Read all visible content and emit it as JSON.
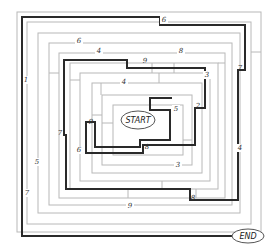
{
  "diagram": {
    "type": "maze",
    "start_label": "START",
    "end_label": "END",
    "path_numbers": [
      {
        "text": "6",
        "x": 164,
        "y": 22
      },
      {
        "text": "6",
        "x": 79,
        "y": 43
      },
      {
        "text": "4",
        "x": 99,
        "y": 53
      },
      {
        "text": "8",
        "x": 181,
        "y": 53
      },
      {
        "text": "7",
        "x": 240,
        "y": 70
      },
      {
        "text": "1",
        "x": 26,
        "y": 82
      },
      {
        "text": "9",
        "x": 145,
        "y": 62
      },
      {
        "text": "3",
        "x": 207,
        "y": 77
      },
      {
        "text": "4",
        "x": 124,
        "y": 84
      },
      {
        "text": "2",
        "x": 197,
        "y": 108
      },
      {
        "text": "5",
        "x": 176,
        "y": 111
      },
      {
        "text": "9",
        "x": 91,
        "y": 124
      },
      {
        "text": "7",
        "x": 60,
        "y": 135
      },
      {
        "text": "6",
        "x": 79,
        "y": 152
      },
      {
        "text": "8",
        "x": 146,
        "y": 147
      },
      {
        "text": "4",
        "x": 240,
        "y": 150
      },
      {
        "text": "5",
        "x": 37,
        "y": 164
      },
      {
        "text": "3",
        "x": 178,
        "y": 167
      },
      {
        "text": "7",
        "x": 27,
        "y": 195
      },
      {
        "text": "8",
        "x": 193,
        "y": 199
      },
      {
        "text": "9",
        "x": 130,
        "y": 208
      }
    ]
  }
}
